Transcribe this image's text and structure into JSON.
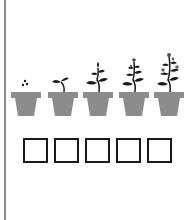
{
  "worksheet": {
    "colors": {
      "pot": "#8c8c8c",
      "plant": "#1a1a1a",
      "box_border": "#1a1a1a",
      "edge_line": "#8a8a8a"
    },
    "stages": [
      {
        "name": "seeds",
        "pot_icon": "pot-with-seeds-icon",
        "x": 11
      },
      {
        "name": "sprout",
        "pot_icon": "pot-with-sprout-icon",
        "x": 48
      },
      {
        "name": "young-plant",
        "pot_icon": "pot-with-young-plant-icon",
        "x": 83
      },
      {
        "name": "budding-plant",
        "pot_icon": "pot-with-budding-plant-icon",
        "x": 119
      },
      {
        "name": "flowering-plant",
        "pot_icon": "pot-with-flowering-plant-icon",
        "x": 154
      }
    ],
    "answer_boxes": [
      {
        "value": "",
        "x": 23
      },
      {
        "value": "",
        "x": 54
      },
      {
        "value": "",
        "x": 85
      },
      {
        "value": "",
        "x": 116
      },
      {
        "value": "",
        "x": 147
      }
    ]
  }
}
